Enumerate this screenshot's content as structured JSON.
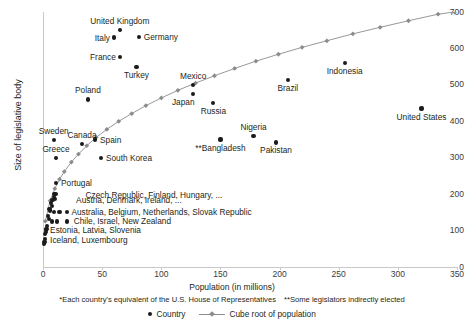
{
  "chart_data": {
    "type": "scatter",
    "title": "",
    "xlabel": "Population (in millions)",
    "ylabel": "Size of legislative body",
    "xlim": [
      0,
      350
    ],
    "ylim": [
      0,
      700
    ],
    "xticks": [
      0,
      50,
      100,
      150,
      200,
      250,
      300,
      350
    ],
    "yticks": [
      0,
      100,
      200,
      300,
      400,
      500,
      600,
      700
    ],
    "grid": false,
    "legend_position": "bottom-center",
    "series": [
      {
        "name": "Country",
        "type": "scatter",
        "points": [
          {
            "label": "United Kingdom",
            "x": 65,
            "y": 650,
            "label_pos": "above"
          },
          {
            "label": "Italy",
            "x": 60,
            "y": 630,
            "label_pos": "left"
          },
          {
            "label": "Germany",
            "x": 81,
            "y": 631,
            "label_pos": "right"
          },
          {
            "label": "France",
            "x": 65,
            "y": 577,
            "label_pos": "left"
          },
          {
            "label": "Turkey",
            "x": 79,
            "y": 550,
            "label_pos": "below"
          },
          {
            "label": "Mexico",
            "x": 127,
            "y": 500,
            "label_pos": "above"
          },
          {
            "label": "Poland",
            "x": 38,
            "y": 460,
            "label_pos": "above"
          },
          {
            "label": "Japan",
            "x": 127,
            "y": 475,
            "label_pos": "below-left"
          },
          {
            "label": "Russia",
            "x": 144,
            "y": 450,
            "label_pos": "below"
          },
          {
            "label": "Brazil",
            "x": 207,
            "y": 513,
            "label_pos": "below"
          },
          {
            "label": "Indonesia",
            "x": 255,
            "y": 560,
            "label_pos": "below"
          },
          {
            "label": "United States",
            "x": 320,
            "y": 435,
            "label_pos": "below"
          },
          {
            "label": "**Bangladesh",
            "x": 150,
            "y": 350,
            "label_pos": "below"
          },
          {
            "label": "Nigeria",
            "x": 178,
            "y": 360,
            "label_pos": "above"
          },
          {
            "label": "Pakistan",
            "x": 197,
            "y": 342,
            "label_pos": "below"
          },
          {
            "label": "Sweden",
            "x": 9,
            "y": 349,
            "label_pos": "above"
          },
          {
            "label": "Canada",
            "x": 33,
            "y": 338,
            "label_pos": "above"
          },
          {
            "label": "Spain",
            "x": 44,
            "y": 350,
            "label_pos": "right"
          },
          {
            "label": "Greece",
            "x": 11,
            "y": 300,
            "label_pos": "above"
          },
          {
            "label": "South Korea",
            "x": 49,
            "y": 299,
            "label_pos": "right"
          },
          {
            "label": "Portugal",
            "x": 11,
            "y": 230,
            "label_pos": "right"
          }
        ],
        "cluster_points": [
          {
            "x": 9.5,
            "y": 200
          },
          {
            "x": 10.5,
            "y": 200
          },
          {
            "x": 9.0,
            "y": 193
          },
          {
            "x": 10.0,
            "y": 186
          },
          {
            "x": 8.0,
            "y": 183
          },
          {
            "x": 6.5,
            "y": 176
          },
          {
            "x": 7.5,
            "y": 168
          },
          {
            "x": 5.5,
            "y": 160
          },
          {
            "x": 6.0,
            "y": 155
          },
          {
            "x": 9.0,
            "y": 150
          },
          {
            "x": 14.0,
            "y": 150
          },
          {
            "x": 20.0,
            "y": 150
          },
          {
            "x": 4.5,
            "y": 140
          },
          {
            "x": 5.0,
            "y": 131
          },
          {
            "x": 7.5,
            "y": 125
          },
          {
            "x": 12.0,
            "y": 125
          },
          {
            "x": 20.0,
            "y": 125
          },
          {
            "x": 3.5,
            "y": 113
          },
          {
            "x": 3.0,
            "y": 104
          },
          {
            "x": 2.5,
            "y": 101
          },
          {
            "x": 2.2,
            "y": 96
          },
          {
            "x": 2.0,
            "y": 90
          },
          {
            "x": 1.5,
            "y": 76
          },
          {
            "x": 1.2,
            "y": 68
          },
          {
            "x": 1.0,
            "y": 63
          }
        ],
        "cluster_labels": [
          {
            "text": "Czech Republic, Finland, Hungary, ...",
            "x": 36,
            "y": 197
          },
          {
            "text": "Austria, Denmark, Ireland, ...",
            "x": 28,
            "y": 184
          },
          {
            "text": "Australia, Belgium, Netherlands, Slovak Republic",
            "x": 24,
            "y": 150
          },
          {
            "text": "Chile, Israel, New Zealand",
            "x": 26,
            "y": 125
          },
          {
            "text": "Estonia, Latvia, Slovenia",
            "x": 6,
            "y": 101
          },
          {
            "text": "Iceland, Luxembourg",
            "x": 6,
            "y": 73
          }
        ]
      },
      {
        "name": "Cube root of population",
        "type": "line",
        "marker": "diamond",
        "color": "#8c8c8c",
        "x": [
          2,
          6,
          10,
          14,
          18,
          24,
          30,
          37,
          45,
          54,
          64,
          75,
          87,
          100,
          114,
          129,
          145,
          162,
          180,
          199,
          219,
          240,
          262,
          285,
          309,
          334,
          348
        ],
        "y": [
          126,
          182,
          215,
          241,
          262,
          288,
          310,
          333,
          356,
          378,
          400,
          421,
          443,
          464,
          485,
          505,
          525,
          545,
          565,
          584,
          603,
          621,
          640,
          658,
          676,
          694,
          700
        ]
      }
    ],
    "footnotes": [
      "*Each country's equivalent of the U.S. House of Representatives",
      "**Some legislators indirectly elected"
    ],
    "legend": [
      {
        "label": "Country",
        "marker": "dot"
      },
      {
        "label": "Cube root of population",
        "marker": "line-diamond"
      }
    ]
  }
}
